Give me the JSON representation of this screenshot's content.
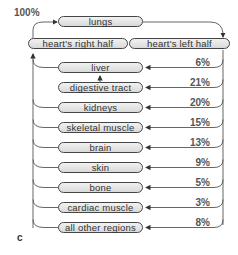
{
  "diagram": {
    "title_percent": "100%",
    "panel_label": "c",
    "top_nodes": {
      "lungs": "lungs",
      "heart_right": "heart's right half",
      "heart_left": "heart's left half"
    },
    "regions": [
      {
        "name": "liver",
        "percent": "6%"
      },
      {
        "name": "digestive tract",
        "percent": "21%"
      },
      {
        "name": "kidneys",
        "percent": "20%"
      },
      {
        "name": "skeletal muscle",
        "percent": "15%"
      },
      {
        "name": "brain",
        "percent": "13%"
      },
      {
        "name": "skin",
        "percent": "9%"
      },
      {
        "name": "bone",
        "percent": "5%"
      },
      {
        "name": "cardiac muscle",
        "percent": "3%"
      },
      {
        "name": "all other regions",
        "percent": "8%"
      }
    ],
    "colors": {
      "box_fill": "#e0e0e0",
      "line": "#444444",
      "text": "#333333"
    }
  }
}
